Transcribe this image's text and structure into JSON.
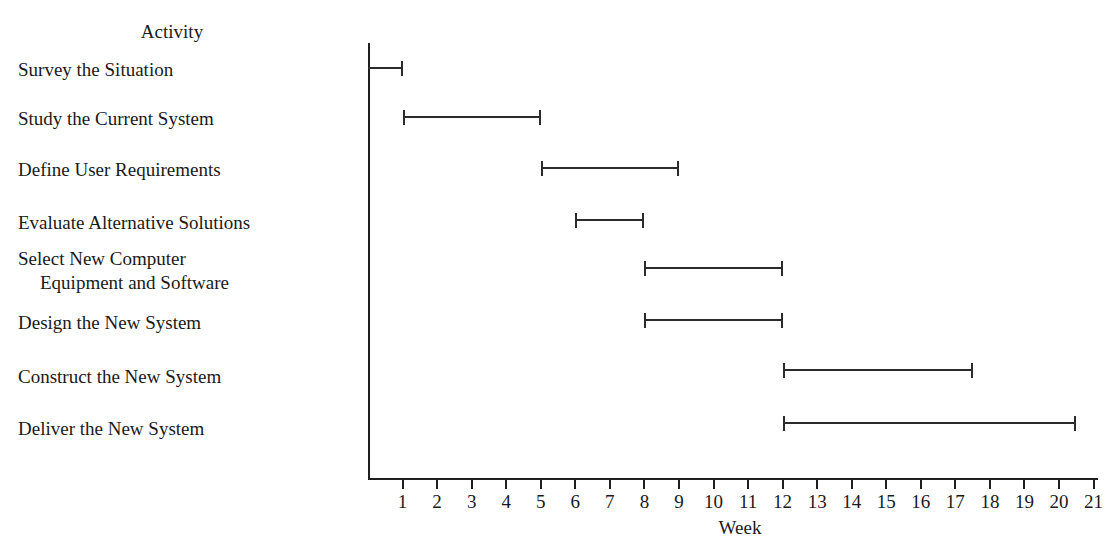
{
  "header": {
    "activity_column_title": "Activity"
  },
  "axis": {
    "title": "Week",
    "tick_labels": [
      "1",
      "2",
      "3",
      "4",
      "5",
      "6",
      "7",
      "8",
      "9",
      "10",
      "11",
      "12",
      "13",
      "14",
      "15",
      "16",
      "17",
      "18",
      "19",
      "20",
      "21"
    ],
    "min": 0,
    "max": 21
  },
  "chart_data": {
    "type": "bar",
    "title": "",
    "xlabel": "Week",
    "ylabel": "Activity",
    "xlim": [
      0,
      21
    ],
    "grid": false,
    "legend": null,
    "orientation": "horizontal",
    "bar_style": "gantt-range",
    "categories": [
      "Survey the Situation",
      "Study the Current System",
      "Define User Requirements",
      "Evaluate Alternative Solutions",
      "Select New Computer Equipment and Software",
      "Design the New System",
      "Construct the New System",
      "Deliver the New System"
    ],
    "tasks": [
      {
        "label": "Survey the Situation",
        "label_lines": [
          "Survey the Situation"
        ],
        "start": 0,
        "end": 1,
        "duration": 1
      },
      {
        "label": "Study the Current System",
        "label_lines": [
          "Study the Current System"
        ],
        "start": 1,
        "end": 5,
        "duration": 4
      },
      {
        "label": "Define User Requirements",
        "label_lines": [
          "Define User Requirements"
        ],
        "start": 5,
        "end": 9,
        "duration": 4
      },
      {
        "label": "Evaluate Alternative Solutions",
        "label_lines": [
          "Evaluate Alternative Solutions"
        ],
        "start": 6,
        "end": 8,
        "duration": 2
      },
      {
        "label": "Select New Computer Equipment and Software",
        "label_lines": [
          "Select New Computer",
          "Equipment and Software"
        ],
        "start": 8,
        "end": 12,
        "duration": 4
      },
      {
        "label": "Design the New System",
        "label_lines": [
          "Design the New System"
        ],
        "start": 8,
        "end": 12,
        "duration": 4
      },
      {
        "label": "Construct the New System",
        "label_lines": [
          "Construct the New System"
        ],
        "start": 12,
        "end": 17.5,
        "duration": 5.5
      },
      {
        "label": "Deliver the New System",
        "label_lines": [
          "Deliver the New System"
        ],
        "start": 12,
        "end": 20.5,
        "duration": 8.5
      }
    ]
  },
  "colors": {
    "bar": "#2b2b2b",
    "axis": "#1f1f1f",
    "text": "#1a1a1a",
    "background": "#ffffff"
  }
}
